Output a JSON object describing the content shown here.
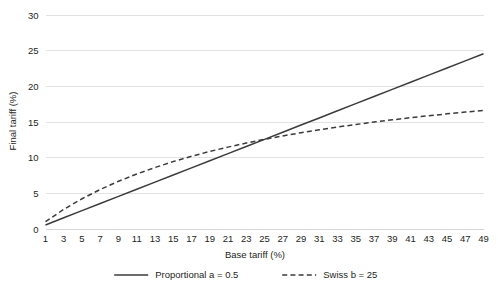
{
  "chart_data": {
    "type": "line",
    "title": "",
    "xlabel": "Base tariff (%)",
    "ylabel": "Final tariff (%)",
    "xlim": [
      1,
      49
    ],
    "ylim": [
      0,
      30
    ],
    "grid": true,
    "legend_position": "bottom",
    "x_ticks": [
      1,
      3,
      5,
      7,
      9,
      11,
      13,
      15,
      17,
      19,
      21,
      23,
      25,
      27,
      29,
      31,
      33,
      35,
      37,
      39,
      41,
      43,
      45,
      47,
      49
    ],
    "y_ticks": [
      0,
      5,
      10,
      15,
      20,
      25,
      30
    ],
    "x": [
      1,
      3,
      5,
      7,
      9,
      11,
      13,
      15,
      17,
      19,
      21,
      23,
      25,
      27,
      29,
      31,
      33,
      35,
      37,
      39,
      41,
      43,
      45,
      47,
      49
    ],
    "series": [
      {
        "name": "Proportional a = 0.5",
        "style": "solid",
        "color": "#3b3b3b",
        "values": [
          0.5,
          1.5,
          2.5,
          3.5,
          4.5,
          5.5,
          6.5,
          7.5,
          8.5,
          9.5,
          10.5,
          11.5,
          12.5,
          13.5,
          14.5,
          15.5,
          16.5,
          17.5,
          18.5,
          19.5,
          20.5,
          21.5,
          22.5,
          23.5,
          24.5
        ]
      },
      {
        "name": "Swiss b = 25",
        "style": "dashed",
        "color": "#3b3b3b",
        "values": [
          0.96,
          2.68,
          4.17,
          5.47,
          6.62,
          7.64,
          8.55,
          9.38,
          10.12,
          10.8,
          11.41,
          11.98,
          12.5,
          12.98,
          13.43,
          13.84,
          14.22,
          14.58,
          14.92,
          15.23,
          15.53,
          15.81,
          16.07,
          16.32,
          16.55
        ]
      }
    ]
  },
  "legend": {
    "items": [
      {
        "label": "Proportional a = 0.5",
        "style": "solid"
      },
      {
        "label": "Swiss b = 25",
        "style": "dashed"
      }
    ]
  },
  "axes": {
    "x_title": "Base tariff (%)",
    "y_title": "Final tariff (%)"
  },
  "colors": {
    "line": "#3b3b3b",
    "grid": "#e2e2e4",
    "text": "#231f20",
    "background": "#ffffff"
  }
}
